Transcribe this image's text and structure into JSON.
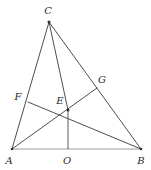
{
  "figure": {
    "type": "euclidean-geometry-diagram",
    "background_color": "#ffffff",
    "line_color": "#3a3a3a",
    "base_line_color": "#9b9b9b",
    "label_color": "#2b2b2b",
    "width": 151,
    "height": 170,
    "points": {
      "A": {
        "label": "A",
        "x": 12,
        "y": 149,
        "label_x": 9,
        "label_y": 160
      },
      "B": {
        "label": "B",
        "x": 141,
        "y": 149,
        "label_x": 141,
        "label_y": 160
      },
      "C": {
        "label": "C",
        "x": 49,
        "y": 22,
        "label_x": 48,
        "label_y": 11
      },
      "O": {
        "label": "O",
        "x": 68,
        "y": 149,
        "label_x": 67,
        "label_y": 160
      },
      "E": {
        "label": "E",
        "x": 68,
        "y": 110,
        "label_x": 60,
        "label_y": 101
      },
      "F": {
        "label": "F",
        "x": 28,
        "y": 102,
        "label_x": 18,
        "label_y": 97
      },
      "G": {
        "label": "G",
        "x": 97,
        "y": 88,
        "label_x": 102,
        "label_y": 80
      }
    },
    "segments": [
      {
        "name": "segment-CA",
        "from": "C",
        "to": "A",
        "style": "solid"
      },
      {
        "name": "segment-CB",
        "from": "C",
        "to": "B",
        "style": "solid"
      },
      {
        "name": "segment-CO",
        "from": "C",
        "to": "O",
        "style": "solid"
      },
      {
        "name": "segment-AG",
        "from": "A",
        "to": "G",
        "style": "solid"
      },
      {
        "name": "segment-FB",
        "from": "F",
        "to": "B",
        "style": "solid"
      },
      {
        "name": "segment-AB",
        "from": "A",
        "to": "B",
        "style": "base"
      }
    ]
  }
}
